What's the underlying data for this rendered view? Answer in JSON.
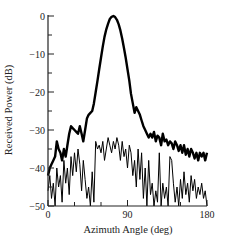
{
  "chart_data": {
    "type": "line",
    "title": "",
    "xlabel": "Azimuth Angle (deg)",
    "ylabel": "Received Power (dB)",
    "xlim": [
      0,
      180
    ],
    "ylim": [
      -50,
      0
    ],
    "x_ticks": [
      0,
      90,
      180
    ],
    "x_minor_ticks": [
      30,
      60,
      120,
      150
    ],
    "y_ticks": [
      0,
      -10,
      -20,
      -30,
      -40,
      -50
    ],
    "y_minor_ticks": [
      -5,
      -15,
      -25,
      -35,
      -45
    ],
    "grid": false,
    "legend": null,
    "series": [
      {
        "name": "thick",
        "style": "thick",
        "x": [
          0,
          2,
          4,
          6,
          8,
          10,
          12,
          14,
          16,
          18,
          20,
          22,
          24,
          26,
          28,
          30,
          32,
          34,
          36,
          38,
          40,
          42,
          44,
          46,
          48,
          50,
          52,
          54,
          56,
          58,
          60,
          62,
          64,
          66,
          68,
          70,
          72,
          74,
          76,
          78,
          80,
          82,
          84,
          86,
          88,
          90,
          92,
          94,
          96,
          98,
          100,
          102,
          104,
          106,
          108,
          110,
          112,
          114,
          116,
          118,
          120,
          122,
          124,
          126,
          128,
          130,
          132,
          134,
          136,
          138,
          140,
          142,
          144,
          146,
          148,
          150,
          152,
          154,
          156,
          158,
          160,
          162,
          164,
          166,
          168,
          170,
          172,
          174,
          176,
          178,
          180
        ],
        "values": [
          -42,
          -40,
          -39,
          -38,
          -37,
          -33,
          -35,
          -36,
          -38,
          -35,
          -37,
          -34,
          -31,
          -29,
          -29.5,
          -30,
          -30.5,
          -31,
          -29,
          -31,
          -33,
          -30,
          -27,
          -26,
          -25.5,
          -25,
          -23,
          -20,
          -17,
          -14,
          -11,
          -8,
          -5.5,
          -3.5,
          -2,
          -0.8,
          -0.2,
          0,
          -0.3,
          -1,
          -2.2,
          -3.8,
          -6,
          -8.5,
          -11,
          -14,
          -17,
          -20.5,
          -23,
          -25.5,
          -24,
          -25,
          -26,
          -27.5,
          -29,
          -30,
          -31,
          -32,
          -31,
          -32,
          -30.5,
          -33,
          -31.5,
          -32,
          -34,
          -31,
          -33,
          -32.5,
          -34,
          -33,
          -33.5,
          -35,
          -33,
          -34,
          -35.5,
          -34,
          -36,
          -34,
          -36.5,
          -35,
          -37,
          -35,
          -36,
          -37.5,
          -36,
          -38,
          -36,
          -37,
          -36,
          -38,
          -36
        ],
        "color": "#000000"
      },
      {
        "name": "thin",
        "style": "thin",
        "x": [
          0,
          2,
          4,
          6,
          8,
          10,
          12,
          14,
          16,
          18,
          20,
          22,
          24,
          26,
          28,
          30,
          32,
          34,
          36,
          38,
          40,
          42,
          44,
          46,
          48,
          50,
          52,
          54,
          56,
          58,
          60,
          62,
          64,
          66,
          68,
          70,
          72,
          74,
          76,
          78,
          80,
          82,
          84,
          86,
          88,
          90,
          92,
          94,
          96,
          98,
          100,
          102,
          104,
          106,
          108,
          110,
          112,
          114,
          116,
          118,
          120,
          122,
          124,
          126,
          128,
          130,
          132,
          134,
          136,
          138,
          140,
          142,
          144,
          146,
          148,
          150,
          152,
          154,
          156,
          158,
          160,
          162,
          164,
          166,
          168,
          170,
          172,
          174,
          176,
          178,
          180
        ],
        "values": [
          -46,
          -42,
          -48,
          -44,
          -50,
          -40,
          -45,
          -42,
          -49,
          -38,
          -44,
          -40,
          -47,
          -37,
          -42,
          -36,
          -41,
          -35,
          -39,
          -46,
          -38,
          -43,
          -48,
          -45,
          -50,
          -41,
          -49,
          -33,
          -35,
          -34,
          -36,
          -33,
          -38,
          -35,
          -32,
          -34,
          -36,
          -33,
          -35,
          -32,
          -34,
          -38,
          -33,
          -37,
          -35,
          -40,
          -34,
          -36,
          -42,
          -38,
          -45,
          -35,
          -43,
          -36,
          -48,
          -40,
          -50,
          -38,
          -47,
          -44,
          -50,
          -46,
          -49,
          -36,
          -50,
          -44,
          -48,
          -45,
          -50,
          -37,
          -38,
          -44,
          -49,
          -45,
          -50,
          -43,
          -48,
          -41,
          -47,
          -44,
          -49,
          -42,
          -46,
          -43,
          -48,
          -45,
          -47,
          -44,
          -48,
          -46,
          -50
        ],
        "color": "#000000"
      }
    ]
  }
}
